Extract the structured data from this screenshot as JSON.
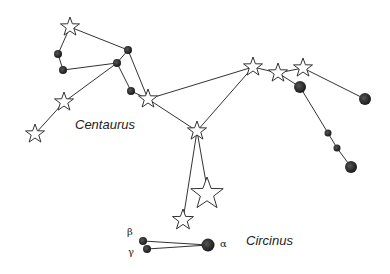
{
  "labels": {
    "centaurus": "Centaurus",
    "circinus": "Circinus",
    "beta": "β",
    "gamma": "γ",
    "alpha": "α"
  },
  "colors": {
    "line": "#333333",
    "dot": "#222222",
    "star_fill": "#ffffff"
  }
}
